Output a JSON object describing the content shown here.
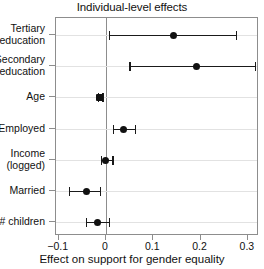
{
  "chart_data": {
    "type": "scatter",
    "title": "Individual-level effects",
    "xlabel": "Effect on support for gender equality",
    "ylabel": "",
    "xlim": [
      -0.1056,
      0.3234
    ],
    "grid": true,
    "legend": "none",
    "orientation": "horizontal",
    "xticks": [
      -0.1,
      0,
      0.1,
      0.2,
      0.3
    ],
    "xticklabels": [
      "−0.1",
      "0",
      "0.1",
      "0.2",
      "0.3"
    ],
    "reference_line": 0,
    "categories": [
      "Tertiary education",
      "Secondary education",
      "Age",
      "Employed",
      "Income (logged)",
      "Married",
      "# children"
    ],
    "series": [
      {
        "name": "Effect on support for gender equality",
        "estimates": [
          0.142,
          0.192,
          -0.013,
          0.036,
          0.0,
          -0.042,
          -0.017
        ],
        "ci_low": [
          0.006,
          0.049,
          -0.017,
          0.015,
          -0.011,
          -0.078,
          -0.042
        ],
        "ci_high": [
          0.275,
          0.315,
          -0.008,
          0.061,
          0.013,
          -0.013,
          0.006
        ]
      }
    ]
  },
  "axis": {
    "y_labels": [
      {
        "line1": "Tertiary",
        "line2": "education"
      },
      {
        "line1": "Secondary",
        "line2": "education"
      },
      {
        "line1": "Age",
        "line2": ""
      },
      {
        "line1": "Employed",
        "line2": ""
      },
      {
        "line1": "Income",
        "line2": "(logged)"
      },
      {
        "line1": "Married",
        "line2": ""
      },
      {
        "line1": "# children",
        "line2": ""
      }
    ],
    "x_tick_labels": [
      "−0.1",
      "0",
      "0.1",
      "0.2",
      "0.3"
    ]
  },
  "colors": {
    "marker": "#111111",
    "line": "#1a1a1a",
    "frame": "#8d8d8d",
    "grid": "#e2e2e2",
    "background": "#ffffff"
  }
}
